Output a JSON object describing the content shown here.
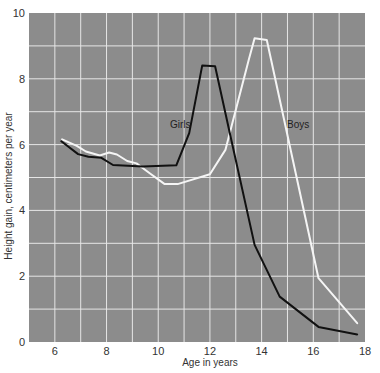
{
  "chart_data": {
    "type": "line",
    "title": "",
    "xlabel": "Age in years",
    "ylabel": "Height gain, centimeters per year",
    "xlim": [
      5,
      18
    ],
    "ylim": [
      0,
      10
    ],
    "x_ticks": [
      6,
      8,
      10,
      12,
      14,
      16,
      18
    ],
    "y_ticks": [
      0,
      2,
      4,
      6,
      8,
      10
    ],
    "grid": true,
    "grid_step_x": 1,
    "grid_step_y": 1,
    "legend": "inline labels",
    "series": [
      {
        "name": "Girls",
        "color": "#111111",
        "x": [
          6.25,
          6.9,
          7.3,
          7.8,
          8.25,
          9.4,
          10.7,
          11.2,
          11.7,
          12.2,
          12.8,
          13.73,
          14.7,
          16.2,
          17.7
        ],
        "y": [
          6.1,
          5.71,
          5.63,
          5.6,
          5.38,
          5.33,
          5.37,
          6.35,
          8.4,
          8.38,
          6.24,
          2.95,
          1.38,
          0.46,
          0.23
        ]
      },
      {
        "name": "Boys",
        "color": "#f5f5f5",
        "x": [
          6.28,
          6.85,
          7.2,
          7.74,
          8.1,
          8.4,
          8.8,
          9.16,
          9.67,
          10.25,
          10.75,
          12.0,
          12.6,
          13.5,
          13.73,
          14.2,
          16.2,
          17.7
        ],
        "y": [
          6.16,
          5.96,
          5.79,
          5.67,
          5.76,
          5.7,
          5.5,
          5.43,
          5.13,
          4.8,
          4.8,
          5.1,
          5.84,
          8.57,
          9.23,
          9.18,
          1.94,
          0.57
        ]
      }
    ],
    "annotations": [
      {
        "text": "Girls",
        "x": 10.9,
        "y": 6.55
      },
      {
        "text": "Boys",
        "x": 14.9,
        "y": 6.55
      }
    ]
  },
  "labels": {
    "girls": "Girls",
    "boys": "Boys",
    "xlabel": "Age in years",
    "ylabel": "Height gain, centimeters per year"
  },
  "colors": {
    "plot_background": "#8c8c8c",
    "grid": "#e6e6e6",
    "girls_line": "#111111",
    "boys_line": "#f5f5f5"
  }
}
